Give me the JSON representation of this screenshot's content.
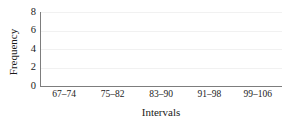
{
  "chart_data": {
    "type": "bar",
    "title": "",
    "xlabel": "Intervals",
    "ylabel": "Frequency",
    "categories": [
      "67–74",
      "75–82",
      "83–90",
      "91–98",
      "99–106"
    ],
    "values": [
      0,
      0,
      0,
      0,
      0
    ],
    "ylim": [
      0,
      8
    ],
    "yticks": [
      8,
      6,
      4,
      2,
      0
    ],
    "ytick_labels": [
      "8",
      "6",
      "4",
      "2",
      "0"
    ],
    "gridlines": [
      2,
      4,
      6,
      8
    ],
    "grid": true,
    "grid_axis": "y",
    "legend": false,
    "legend_position": "none",
    "colors": {
      "background": "#ffffff",
      "axis": "#7d7d7d",
      "grid": "#f1f1f1",
      "text": "#1a1a1a",
      "bar": "#7f7f7f"
    }
  }
}
